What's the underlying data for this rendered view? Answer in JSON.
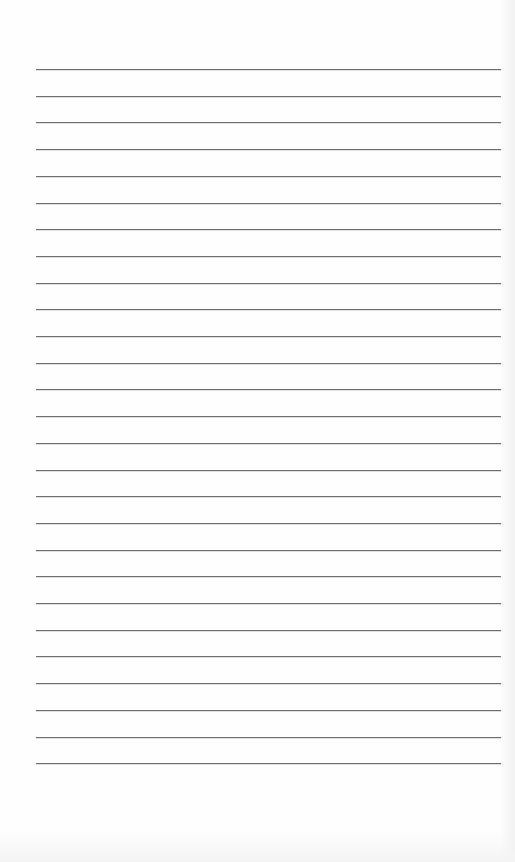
{
  "page": {
    "type": "blank lined paper",
    "background_color": "#fdfdfd",
    "line_color": "#6f6f6f",
    "line_count": 27,
    "first_line_y": 69,
    "line_spacing": 26.7,
    "line_left": 36,
    "line_right": 501,
    "text_lines": [
      "",
      "",
      "",
      "",
      "",
      "",
      "",
      "",
      "",
      "",
      "",
      "",
      "",
      "",
      "",
      "",
      "",
      "",
      "",
      "",
      "",
      "",
      "",
      "",
      "",
      "",
      ""
    ]
  }
}
